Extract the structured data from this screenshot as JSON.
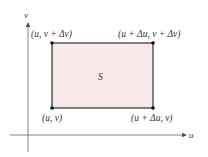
{
  "diagram": {
    "axes": {
      "x_label": "u",
      "y_label": "v"
    },
    "region": {
      "label": "S",
      "fill": "#f7e9e9",
      "stroke": "#333333"
    },
    "corners": {
      "top_left": "(u, v + Δv)",
      "top_right": "(u + Δu, v + Δv)",
      "bottom_left": "(u, v)",
      "bottom_right": "(u + Δu, v)"
    }
  }
}
